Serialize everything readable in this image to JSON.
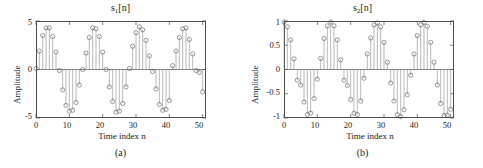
{
  "figure": {
    "background": "#ffffff",
    "axis_color": "#4d4d4d",
    "stem_color": "#8c8c8c",
    "marker_color": "#595959"
  },
  "panels": [
    {
      "id": "panel-a",
      "caption": "(a)",
      "title_base": "s",
      "title_sub": "1",
      "title_tail": "[n]",
      "title_text": "s1[n]",
      "xlabel": "Time index n",
      "ylabel": "Amplitude",
      "yticks": [
        "5",
        "0",
        "-5"
      ],
      "ytick_values": [
        5,
        0,
        -5
      ],
      "xticks": [
        "0",
        "10",
        "20",
        "30",
        "40",
        "50"
      ],
      "xtick_values": [
        0,
        10,
        20,
        30,
        40,
        50
      ]
    },
    {
      "id": "panel-b",
      "caption": "(b)",
      "title_base": "s",
      "title_sub": "2",
      "title_tail": "[n]",
      "title_text": "s2[n]",
      "xlabel": "Time index n",
      "ylabel": "Amplitude",
      "yticks": [
        "1",
        "0.5",
        "0",
        "-0.5",
        "-1"
      ],
      "ytick_values": [
        1,
        0.5,
        0,
        -0.5,
        -1
      ],
      "xticks": [
        "0",
        "10",
        "20",
        "30",
        "40",
        "50"
      ],
      "xtick_values": [
        0,
        10,
        20,
        30,
        40,
        50
      ]
    }
  ],
  "chart_data": [
    {
      "type": "line",
      "subtype": "stem",
      "panel": "(a)",
      "title": "s1[n]",
      "xlabel": "Time index n",
      "ylabel": "Amplitude",
      "xlim": [
        0,
        51
      ],
      "ylim": [
        -5,
        5
      ],
      "grid": false,
      "legend": null,
      "x": [
        0,
        1,
        2,
        3,
        4,
        5,
        6,
        7,
        8,
        9,
        10,
        11,
        12,
        13,
        14,
        15,
        16,
        17,
        18,
        19,
        20,
        21,
        22,
        23,
        24,
        25,
        26,
        27,
        28,
        29,
        30,
        31,
        32,
        33,
        34,
        35,
        36,
        37,
        38,
        39,
        40,
        41,
        42,
        43,
        44,
        45,
        46,
        47,
        48,
        49,
        50
      ],
      "values": [
        0.1,
        1.9,
        3.5,
        4.3,
        4.3,
        3.4,
        1.8,
        -0.1,
        -2.1,
        -3.7,
        -4.3,
        -4.2,
        -3.4,
        -1.6,
        0.0,
        1.7,
        3.3,
        4.3,
        4.2,
        3.4,
        1.8,
        0.0,
        -1.8,
        -3.3,
        -4.4,
        -4.3,
        -3.5,
        -1.8,
        0.1,
        2.4,
        3.8,
        4.4,
        4.1,
        3.0,
        1.4,
        -0.2,
        -2.0,
        -3.6,
        -4.2,
        -4.1,
        -3.2,
        0.4,
        1.9,
        3.3,
        4.2,
        4.3,
        3.1,
        1.6,
        -0.1,
        -0.3,
        -2.3
      ]
    },
    {
      "type": "line",
      "subtype": "stem",
      "panel": "(b)",
      "title": "s2[n]",
      "xlabel": "Time index n",
      "ylabel": "Amplitude",
      "xlim": [
        0,
        51
      ],
      "ylim": [
        -1,
        1
      ],
      "grid": false,
      "legend": null,
      "x": [
        0,
        1,
        2,
        3,
        4,
        5,
        6,
        7,
        8,
        9,
        10,
        11,
        12,
        13,
        14,
        15,
        16,
        17,
        18,
        19,
        20,
        21,
        22,
        23,
        24,
        25,
        26,
        27,
        28,
        29,
        30,
        31,
        32,
        33,
        34,
        35,
        36,
        37,
        38,
        39,
        40,
        41,
        42,
        43,
        44,
        45,
        46,
        47,
        48,
        49,
        50
      ],
      "values": [
        0.98,
        0.88,
        0.61,
        0.22,
        -0.22,
        -0.32,
        -0.67,
        -0.93,
        -0.9,
        -0.6,
        -0.2,
        0.23,
        0.64,
        0.9,
        0.98,
        0.9,
        0.61,
        0.2,
        -0.22,
        -0.33,
        -0.62,
        -0.9,
        -0.93,
        -0.65,
        -0.18,
        0.32,
        0.65,
        0.92,
        0.96,
        0.88,
        0.56,
        0.15,
        -0.28,
        -0.65,
        -0.93,
        -0.97,
        -0.83,
        -0.52,
        -0.12,
        0.32,
        0.7,
        0.92,
        0.97,
        0.89,
        0.56,
        0.15,
        -0.32,
        -0.7,
        -0.95,
        -0.94,
        -0.82
      ]
    }
  ]
}
